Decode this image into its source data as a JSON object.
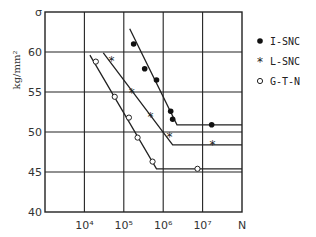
{
  "chart_data": {
    "type": "line",
    "title": "",
    "xlabel": "N",
    "ylabel": "kg/mm²",
    "xscale": "log",
    "xlim": [
      1000,
      100000000
    ],
    "ylim": [
      40,
      65
    ],
    "grid": true,
    "legend_position": "right",
    "x_tick_labels": [
      "10⁴",
      "10⁵",
      "10⁶",
      "10⁷",
      "N"
    ],
    "y_tick_labels": [
      "40",
      "45",
      "50",
      "55",
      "60",
      "σ"
    ],
    "series": [
      {
        "name": "I-SNC",
        "marker": "filled-circle",
        "points": [
          {
            "logN": 5.25,
            "y": 61.0
          },
          {
            "logN": 5.53,
            "y": 57.9
          },
          {
            "logN": 5.83,
            "y": 56.5
          },
          {
            "logN": 6.19,
            "y": 52.6
          },
          {
            "logN": 6.24,
            "y": 51.6
          },
          {
            "logN": 7.23,
            "y": 50.9
          }
        ],
        "fit_line": [
          {
            "logN": 5.15,
            "y": 62.9
          },
          {
            "logN": 6.35,
            "y": 50.9
          },
          {
            "logN": 8.0,
            "y": 50.9
          }
        ]
      },
      {
        "name": "L-SNC",
        "marker": "star",
        "points": [
          {
            "logN": 4.69,
            "y": 59.0
          },
          {
            "logN": 5.2,
            "y": 55.0
          },
          {
            "logN": 5.68,
            "y": 51.9
          },
          {
            "logN": 6.16,
            "y": 49.5
          },
          {
            "logN": 7.25,
            "y": 48.4
          }
        ],
        "fit_line": [
          {
            "logN": 4.48,
            "y": 59.9
          },
          {
            "logN": 6.24,
            "y": 48.4
          },
          {
            "logN": 8.0,
            "y": 48.4
          }
        ]
      },
      {
        "name": "G-T-N",
        "marker": "open-circle",
        "points": [
          {
            "logN": 4.29,
            "y": 58.8
          },
          {
            "logN": 4.77,
            "y": 54.4
          },
          {
            "logN": 5.13,
            "y": 51.8
          },
          {
            "logN": 5.35,
            "y": 49.3
          },
          {
            "logN": 5.73,
            "y": 46.3
          },
          {
            "logN": 6.87,
            "y": 45.4
          }
        ],
        "fit_line": [
          {
            "logN": 4.14,
            "y": 59.6
          },
          {
            "logN": 5.83,
            "y": 45.4
          },
          {
            "logN": 8.0,
            "y": 45.4
          }
        ]
      }
    ]
  },
  "axes": {
    "y_label": "kg/mm²",
    "y_symbol": "σ",
    "x_symbol": "N"
  },
  "legend": {
    "items": [
      {
        "label": "I-SNC",
        "marker": "●"
      },
      {
        "label": "L-SNC",
        "marker": "*"
      },
      {
        "label": "G-T-N",
        "marker": "○"
      }
    ]
  }
}
